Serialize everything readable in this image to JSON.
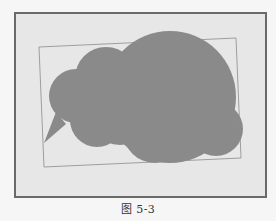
{
  "figure": {
    "caption": "图 5-3",
    "colors": {
      "page_background": "#f6f6f6",
      "frame_fill": "#e7e7e7",
      "frame_border": "#6a6a6a",
      "bounding_box_stroke": "#8c8c8c",
      "cloud_fill": "#8a8a8a"
    },
    "frame": {
      "x": 15,
      "y": 13,
      "width": 251,
      "height": 184
    },
    "bounding_box": {
      "points": [
        [
          39,
          47
        ],
        [
          236,
          38
        ],
        [
          241,
          158
        ],
        [
          44,
          167
        ]
      ]
    },
    "cloud": {
      "lobes": [
        {
          "cx": 76,
          "cy": 96,
          "r": 27
        },
        {
          "cx": 106,
          "cy": 78,
          "r": 31
        },
        {
          "cx": 170,
          "cy": 97,
          "r": 66
        },
        {
          "cx": 216,
          "cy": 129,
          "r": 27
        },
        {
          "cx": 155,
          "cy": 131,
          "r": 32
        },
        {
          "cx": 97,
          "cy": 120,
          "r": 27
        },
        {
          "cx": 120,
          "cy": 110,
          "r": 35
        }
      ],
      "tail": [
        [
          56,
          112
        ],
        [
          44,
          143
        ],
        [
          66,
          124
        ]
      ]
    }
  }
}
